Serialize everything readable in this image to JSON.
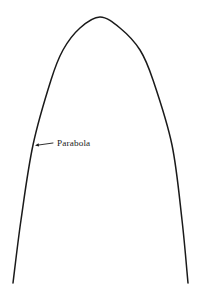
{
  "figure": {
    "background_color": "#ffffff",
    "stroke_color": "#1a1a1a",
    "stroke_width": 1.5,
    "width": 205,
    "height": 297
  },
  "annotation": {
    "label": "Parabola",
    "text_color": "#1a1a1a",
    "font_size": 9.2,
    "label_x": 57,
    "label_baseline_y": 148,
    "arrow": {
      "head_x": 35,
      "head_y": 145.5,
      "tail_x": 53,
      "tail_y": 143,
      "head_size": 4.2,
      "points_to": "parabola-curve-left-branch"
    }
  },
  "chart_data": {
    "type": "line",
    "title": "",
    "xlabel": "",
    "ylabel": "",
    "grid": false,
    "legend": null,
    "axes_visible": false,
    "xlim": [
      0,
      205
    ],
    "ylim": [
      297,
      0
    ],
    "annotations": [
      {
        "text": "Parabola",
        "target_x": 35,
        "target_y": 145.5,
        "text_x": 57,
        "text_y": 148
      }
    ],
    "series": [
      {
        "name": "Parabola",
        "orientation": "downward-opening",
        "vertex": [
          100,
          17
        ],
        "color": "#1a1a1a",
        "points": [
          [
            13,
            283
          ],
          [
            21,
            220
          ],
          [
            33,
            145
          ],
          [
            51,
            80
          ],
          [
            63,
            50
          ],
          [
            80,
            28
          ],
          [
            100,
            17
          ],
          [
            120,
            28
          ],
          [
            140,
            50
          ],
          [
            153,
            80
          ],
          [
            172,
            145
          ],
          [
            182,
            220
          ],
          [
            188,
            283
          ]
        ]
      }
    ]
  }
}
